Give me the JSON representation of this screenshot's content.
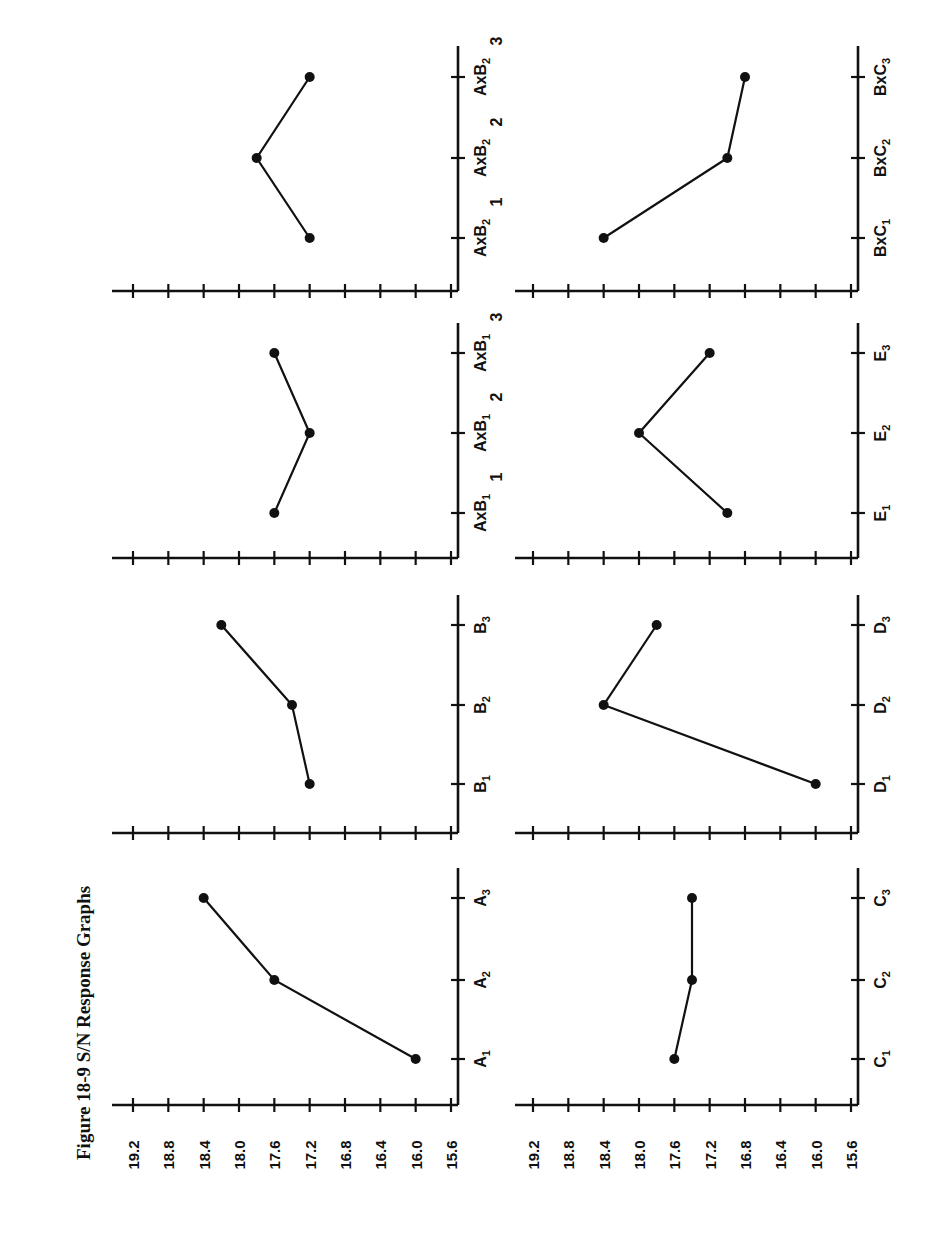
{
  "figure": {
    "title": "Figure 18-9   S/N Response Graphs",
    "orientation": "rotated-90-ccw"
  },
  "chart_data": [
    {
      "type": "line",
      "title": "A",
      "categories": [
        "A1",
        "A2",
        "A3"
      ],
      "values": [
        16.0,
        17.6,
        18.4
      ],
      "ylabel": "S/N",
      "ylim": [
        15.6,
        19.2
      ],
      "yticks": [
        19.2,
        18.8,
        18.4,
        18.0,
        17.6,
        17.2,
        16.8,
        16.4,
        16.0,
        15.6
      ]
    },
    {
      "type": "line",
      "title": "B",
      "categories": [
        "B1",
        "B2",
        "B3"
      ],
      "values": [
        17.2,
        17.4,
        18.2
      ],
      "ylim": [
        15.6,
        19.2
      ]
    },
    {
      "type": "line",
      "title": "AxB1",
      "categories": [
        "AxB1 1",
        "AxB1 2",
        "AxB1 3"
      ],
      "values": [
        17.6,
        17.2,
        17.6
      ],
      "ylim": [
        15.6,
        19.2
      ]
    },
    {
      "type": "line",
      "title": "AxB2",
      "categories": [
        "AxB2 1",
        "AxB2 2",
        "AxB2 3"
      ],
      "values": [
        17.2,
        17.8,
        17.2
      ],
      "ylim": [
        15.6,
        19.2
      ]
    },
    {
      "type": "line",
      "title": "C",
      "categories": [
        "C1",
        "C2",
        "C3"
      ],
      "values": [
        17.6,
        17.4,
        17.4
      ],
      "ylabel": "S/N",
      "ylim": [
        15.6,
        19.2
      ],
      "yticks": [
        19.2,
        18.8,
        18.4,
        18.0,
        17.6,
        17.2,
        16.8,
        16.4,
        16.0,
        15.6
      ]
    },
    {
      "type": "line",
      "title": "D",
      "categories": [
        "D1",
        "D2",
        "D3"
      ],
      "values": [
        16.0,
        18.4,
        17.8
      ],
      "ylim": [
        15.6,
        19.2
      ]
    },
    {
      "type": "line",
      "title": "E",
      "categories": [
        "E1",
        "E2",
        "E3"
      ],
      "values": [
        17.0,
        18.0,
        17.2
      ],
      "ylim": [
        15.6,
        19.2
      ]
    },
    {
      "type": "line",
      "title": "BxC",
      "categories": [
        "BxC1",
        "BxC2",
        "BxC3"
      ],
      "values": [
        18.4,
        17.0,
        16.8
      ],
      "ylim": [
        15.6,
        19.2
      ]
    }
  ],
  "yticks": [
    "19.2",
    "18.8",
    "18.4",
    "18.0",
    "17.6",
    "17.2",
    "16.8",
    "16.4",
    "16.0",
    "15.6"
  ],
  "panels": [
    {
      "col": 0,
      "row": 0,
      "labels": [
        {
          "main": "A",
          "sub": "1",
          "suffix": ""
        },
        {
          "main": "A",
          "sub": "2",
          "suffix": ""
        },
        {
          "main": "A",
          "sub": "3",
          "suffix": ""
        }
      ],
      "values": [
        16.0,
        17.6,
        18.4
      ],
      "show_tick_labels": true
    },
    {
      "col": 0,
      "row": 1,
      "labels": [
        {
          "main": "B",
          "sub": "1",
          "suffix": ""
        },
        {
          "main": "B",
          "sub": "2",
          "suffix": ""
        },
        {
          "main": "B",
          "sub": "3",
          "suffix": ""
        }
      ],
      "values": [
        17.2,
        17.4,
        18.2
      ],
      "show_tick_labels": false
    },
    {
      "col": 0,
      "row": 2,
      "labels": [
        {
          "main": "AxB",
          "sub": "1",
          "suffix": "1"
        },
        {
          "main": "AxB",
          "sub": "1",
          "suffix": "2"
        },
        {
          "main": "AxB",
          "sub": "1",
          "suffix": "3"
        }
      ],
      "values": [
        17.6,
        17.2,
        17.6
      ],
      "show_tick_labels": false
    },
    {
      "col": 0,
      "row": 3,
      "labels": [
        {
          "main": "AxB",
          "sub": "2",
          "suffix": "1"
        },
        {
          "main": "AxB",
          "sub": "2",
          "suffix": "2"
        },
        {
          "main": "AxB",
          "sub": "2",
          "suffix": "3"
        }
      ],
      "values": [
        17.2,
        17.8,
        17.2
      ],
      "show_tick_labels": false
    },
    {
      "col": 1,
      "row": 0,
      "labels": [
        {
          "main": "C",
          "sub": "1",
          "suffix": ""
        },
        {
          "main": "C",
          "sub": "2",
          "suffix": ""
        },
        {
          "main": "C",
          "sub": "3",
          "suffix": ""
        }
      ],
      "values": [
        17.6,
        17.4,
        17.4
      ],
      "show_tick_labels": true
    },
    {
      "col": 1,
      "row": 1,
      "labels": [
        {
          "main": "D",
          "sub": "1",
          "suffix": ""
        },
        {
          "main": "D",
          "sub": "2",
          "suffix": ""
        },
        {
          "main": "D",
          "sub": "3",
          "suffix": ""
        }
      ],
      "values": [
        16.0,
        18.4,
        17.8
      ],
      "show_tick_labels": false
    },
    {
      "col": 1,
      "row": 2,
      "labels": [
        {
          "main": "E",
          "sub": "1",
          "suffix": ""
        },
        {
          "main": "E",
          "sub": "2",
          "suffix": ""
        },
        {
          "main": "E",
          "sub": "3",
          "suffix": ""
        }
      ],
      "values": [
        17.0,
        18.0,
        17.2
      ],
      "show_tick_labels": false
    },
    {
      "col": 1,
      "row": 3,
      "labels": [
        {
          "main": "BxC",
          "sub": "1",
          "suffix": ""
        },
        {
          "main": "BxC",
          "sub": "2",
          "suffix": ""
        },
        {
          "main": "BxC",
          "sub": "3",
          "suffix": ""
        }
      ],
      "values": [
        18.4,
        17.0,
        16.8
      ],
      "show_tick_labels": false
    }
  ],
  "colors": {
    "ink": "#111111",
    "paper": "#ffffff"
  }
}
